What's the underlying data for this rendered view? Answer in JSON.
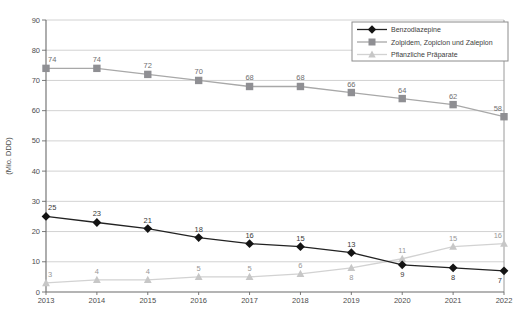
{
  "page": {
    "background": "#ffffff"
  },
  "chart_data": {
    "type": "line",
    "title": "",
    "xlabel": "",
    "ylabel": "(Mio. DDD)",
    "x": [
      2013,
      2014,
      2015,
      2016,
      2017,
      2018,
      2019,
      2020,
      2021,
      2022
    ],
    "ylim": [
      0,
      90
    ],
    "ytick_step": 10,
    "yticks": [
      0,
      10,
      20,
      30,
      40,
      50,
      60,
      70,
      80,
      90
    ],
    "grid": "horizontal",
    "legend_position": "top-right",
    "series": [
      {
        "name": "Pflanzliche Präparate",
        "marker": "triangle",
        "line_color": "#d2d2d2",
        "marker_color": "#c7c7c7",
        "label_color": "#989898",
        "values": [
          3,
          4,
          4,
          5,
          5,
          6,
          8,
          11,
          15,
          16
        ],
        "label_positions": [
          "above",
          "above",
          "above",
          "above",
          "above",
          "above",
          "below",
          "above",
          "above",
          "above"
        ]
      },
      {
        "name": "Zolpidem, Zopiclon und Zaleplon",
        "marker": "square",
        "line_color": "#a8a8a8",
        "marker_color": "#8f8f93",
        "label_color": "#6f6f6f",
        "values": [
          74,
          74,
          72,
          70,
          68,
          68,
          66,
          64,
          62,
          58
        ],
        "label_positions": [
          "above",
          "above",
          "above",
          "above",
          "above",
          "above",
          "above",
          "above",
          "above",
          "above"
        ]
      },
      {
        "name": "Benzodiazepine",
        "marker": "diamond",
        "line_color": "#222222",
        "marker_color": "#141414",
        "label_color": "#3a3a3a",
        "values": [
          25,
          23,
          21,
          18,
          16,
          15,
          13,
          9,
          8,
          7
        ],
        "label_positions": [
          "above",
          "above",
          "above",
          "above",
          "above",
          "above",
          "above",
          "below",
          "below",
          "below"
        ]
      }
    ],
    "legend_order": [
      "Benzodiazepine",
      "Zolpidem, Zopiclon und Zaleplon",
      "Pflanzliche Präparate"
    ],
    "style": {
      "grid_color": "#c6c6c6",
      "axis_color": "#6b6b6b",
      "right_border_color": "#9a9a9a",
      "tick_label_color": "#4d4d4d",
      "legend_border_color": "#8c8c8c",
      "legend_text_color": "#3d3d3d"
    }
  }
}
